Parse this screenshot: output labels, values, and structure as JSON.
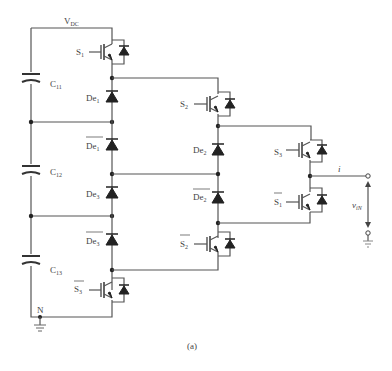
{
  "diagram": {
    "type": "three-level diode-clamped / nested converter leg",
    "caption": "(a)",
    "dc_label": {
      "main": "V",
      "sub": "DC"
    },
    "capacitors": [
      {
        "main": "C",
        "sub": "11"
      },
      {
        "main": "C",
        "sub": "12"
      },
      {
        "main": "C",
        "sub": "13"
      }
    ],
    "switches": [
      {
        "main": "S",
        "sub": "1",
        "bar": false
      },
      {
        "main": "S",
        "sub": "2",
        "bar": false
      },
      {
        "main": "S",
        "sub": "3",
        "bar": false
      },
      {
        "main": "S",
        "sub": "1",
        "bar": true
      },
      {
        "main": "S",
        "sub": "2",
        "bar": true
      },
      {
        "main": "S",
        "sub": "3",
        "bar": true
      }
    ],
    "diodes": [
      {
        "main": "De",
        "sub": "1",
        "bar": false
      },
      {
        "main": "De",
        "sub": "1",
        "bar": true
      },
      {
        "main": "De",
        "sub": "3",
        "bar": false
      },
      {
        "main": "De",
        "sub": "3",
        "bar": true
      },
      {
        "main": "De",
        "sub": "2",
        "bar": false
      },
      {
        "main": "De",
        "sub": "2",
        "bar": true
      }
    ],
    "neutral_label": "N",
    "current_label": "i",
    "voltage_label": {
      "main": "v",
      "sub": "iN"
    }
  }
}
